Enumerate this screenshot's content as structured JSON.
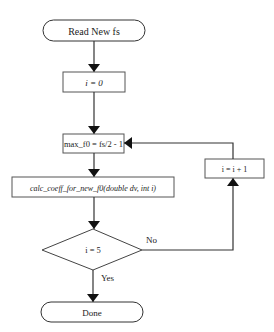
{
  "flowchart": {
    "nodes": {
      "start": {
        "type": "terminal",
        "label": "Read New fs"
      },
      "init_i": {
        "type": "process",
        "label": "i = 0"
      },
      "max_f0": {
        "type": "process",
        "label": "max_f0 = fs/2 - 1"
      },
      "calc": {
        "type": "process",
        "label": "calc_coeff_for_new_f0(double dv, int i)"
      },
      "decision": {
        "type": "decision",
        "label": "i = 5"
      },
      "increment": {
        "type": "process",
        "label": "i = i + 1"
      },
      "done": {
        "type": "terminal",
        "label": "Done"
      }
    },
    "edge_labels": {
      "yes": "Yes",
      "no": "No"
    },
    "edges": [
      {
        "from": "start",
        "to": "init_i"
      },
      {
        "from": "init_i",
        "to": "max_f0"
      },
      {
        "from": "max_f0",
        "to": "calc"
      },
      {
        "from": "calc",
        "to": "decision"
      },
      {
        "from": "decision",
        "to": "done",
        "label": "Yes"
      },
      {
        "from": "decision",
        "to": "increment",
        "label": "No"
      },
      {
        "from": "increment",
        "to": "max_f0"
      }
    ],
    "colors": {
      "stroke": "#333333",
      "fill": "#ffffff",
      "text": "#222222"
    }
  }
}
